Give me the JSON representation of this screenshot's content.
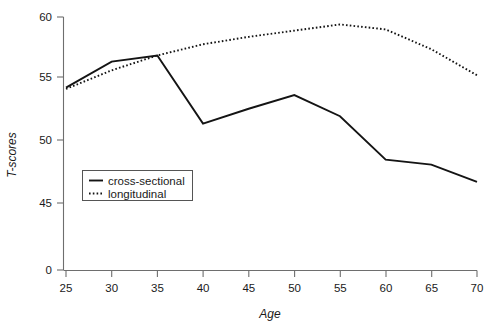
{
  "chart_data": {
    "type": "line",
    "title": "",
    "xlabel": "Age",
    "ylabel": "T-scores",
    "x": [
      25,
      30,
      35,
      40,
      45,
      50,
      55,
      60,
      65,
      70
    ],
    "xticklabels": [
      "25",
      "30",
      "35",
      "40",
      "45",
      "50",
      "55",
      "60",
      "65",
      "70"
    ],
    "yticklabels": [
      "0",
      "45",
      "50",
      "55",
      "60"
    ],
    "yticks": [
      0,
      45,
      50,
      55,
      60
    ],
    "xlim": [
      25,
      70
    ],
    "ylim": [
      45,
      60
    ],
    "axis_break": true,
    "grid": false,
    "legend_position": "inside-lower-left",
    "series": [
      {
        "name": "cross-sectional",
        "style": "solid",
        "color": "#141414",
        "values": [
          54.3,
          56.4,
          56.9,
          51.4,
          52.6,
          53.7,
          52.0,
          48.5,
          48.1,
          46.7
        ]
      },
      {
        "name": "longitudinal",
        "style": "dotted",
        "color": "#141414",
        "values": [
          54.2,
          55.7,
          56.9,
          57.8,
          58.4,
          58.9,
          59.4,
          59.0,
          57.4,
          55.3
        ]
      }
    ]
  },
  "legend": {
    "entries": [
      {
        "label": "cross-sectional",
        "style": "solid"
      },
      {
        "label": "longitudinal",
        "style": "dotted"
      }
    ]
  },
  "axes": {
    "y_title": "T-scores",
    "x_title": "Age"
  }
}
